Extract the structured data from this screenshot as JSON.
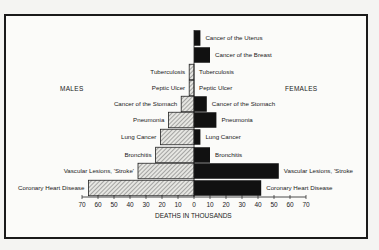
{
  "chart_data": {
    "type": "bar",
    "subtype": "population-pyramid (horizontal, back-to-back)",
    "title": "",
    "xlabel": "DEATHS IN THOUSANDS",
    "ylabel": "",
    "xlim": [
      0,
      70
    ],
    "xticks": [
      70,
      60,
      50,
      40,
      30,
      20,
      10,
      0,
      10,
      20,
      30,
      40,
      50,
      60,
      70
    ],
    "legend": [
      {
        "name": "MALES",
        "position": "left",
        "fill": "hatched"
      },
      {
        "name": "FEMALES",
        "position": "right",
        "fill": "#111111"
      }
    ],
    "categories": [
      "Cancer of the Uterus",
      "Cancer of the Breast",
      "Tuberculosis",
      "Peptic Ulcer",
      "Cancer of the Stomach",
      "Pneumonia",
      "Lung Cancer",
      "Bronchitis",
      "Vascular Lesions, 'Stroke'",
      "Coronary Heart Disease"
    ],
    "series": [
      {
        "name": "MALES",
        "values": [
          null,
          null,
          3,
          3,
          8,
          16,
          21,
          24,
          35,
          66
        ]
      },
      {
        "name": "FEMALES",
        "values": [
          4,
          10,
          0,
          0,
          8,
          14,
          4,
          10,
          53,
          42
        ]
      }
    ],
    "grid": false
  },
  "labels": {
    "males": "MALES",
    "females": "FEMALES",
    "axis_title": "DEATHS IN THOUSANDS",
    "male_labels": [
      "",
      "",
      "Tuberculosis",
      "Peptic Ulcer",
      "Cancer of the Stomach",
      "Pneumonia",
      "Lung Cancer",
      "Bronchitis",
      "Vascular Lesions, 'Stroke'",
      "Coronary Heart Disease"
    ],
    "female_labels": [
      "Cancer of the Uterus",
      "Cancer of the Breast",
      "Tuberculosis",
      "Peptic Ulcer",
      "Cancer of the Stomach",
      "Pneumonia",
      "Lung Cancer",
      "Bronchitis",
      "Vascular Lesions, 'Stroke",
      "Coronary Heart Disease"
    ],
    "ticks": [
      "70",
      "60",
      "50",
      "40",
      "30",
      "20",
      "10",
      "0",
      "10",
      "20",
      "30",
      "40",
      "50",
      "60",
      "70"
    ]
  }
}
